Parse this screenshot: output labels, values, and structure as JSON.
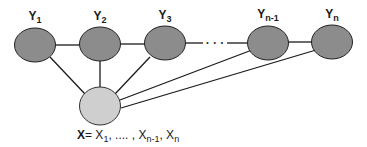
{
  "diagram": {
    "type": "graphical-model",
    "colors": {
      "y_node_fill": "#8c8c8c",
      "x_node_fill": "#cfcfcf",
      "stroke": "#222222",
      "edge": "#1a1a1a"
    },
    "y_nodes": [
      {
        "id": "y1",
        "label": "Y",
        "sub": "1"
      },
      {
        "id": "y2",
        "label": "Y",
        "sub": "2"
      },
      {
        "id": "y3",
        "label": "Y",
        "sub": "3"
      },
      {
        "id": "yn-1",
        "label": "Y",
        "sub": "n-1"
      },
      {
        "id": "yn",
        "label": "Y",
        "sub": "n"
      }
    ],
    "ellipsis": "· · ·",
    "x_node": {
      "id": "x",
      "label_bold": "X",
      "equals": "= ",
      "items": [
        {
          "label": "X",
          "sub": "1",
          "sep": ", .... , "
        },
        {
          "label": "X",
          "sub": "n-1",
          "sep": ", "
        },
        {
          "label": "X",
          "sub": "n",
          "sep": ""
        }
      ]
    },
    "edges": [
      [
        "y1",
        "y2"
      ],
      [
        "y2",
        "y3"
      ],
      [
        "y3",
        "..."
      ],
      [
        "...",
        "yn-1"
      ],
      [
        "yn-1",
        "yn"
      ],
      [
        "x",
        "y1"
      ],
      [
        "x",
        "y2"
      ],
      [
        "x",
        "y3"
      ],
      [
        "x",
        "yn-1"
      ],
      [
        "x",
        "yn"
      ]
    ]
  }
}
